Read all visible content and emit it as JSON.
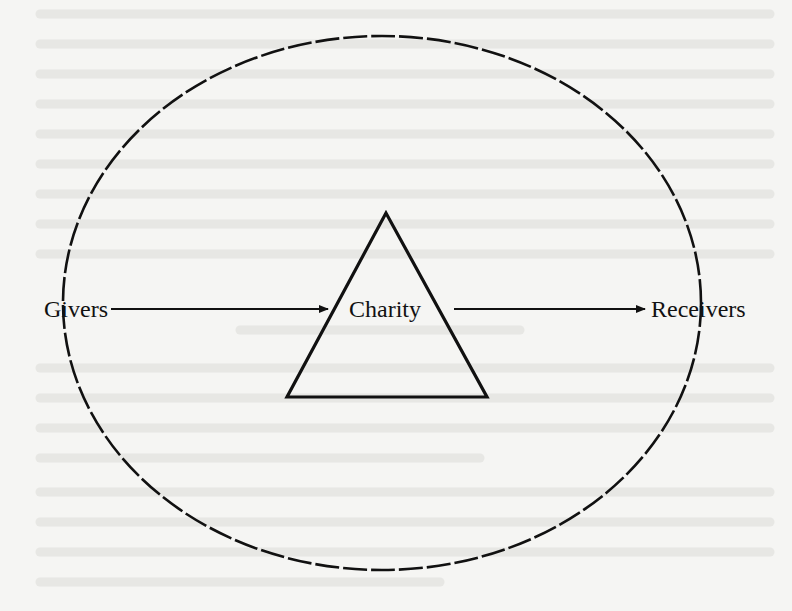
{
  "diagram": {
    "type": "flow",
    "nodes": {
      "givers": {
        "label": "Givers"
      },
      "charity": {
        "label": "Charity"
      },
      "receivers": {
        "label": "Receivers"
      }
    },
    "edges": [
      {
        "from": "givers",
        "to": "charity"
      },
      {
        "from": "charity",
        "to": "receivers"
      }
    ],
    "shapes": {
      "charity_shape": "triangle",
      "enclosure": "dashed-ellipse"
    }
  },
  "colors": {
    "ink": "#111111",
    "paper": "#f5f5f3",
    "bleed_through": "#d9d9d6"
  }
}
